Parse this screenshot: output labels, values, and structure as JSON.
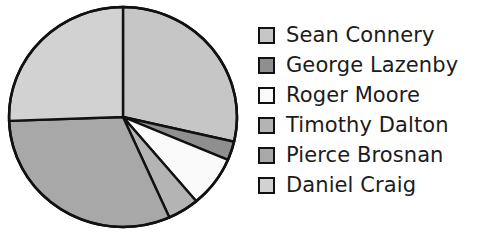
{
  "chart_data": {
    "type": "pie",
    "title": "",
    "subtitle": "",
    "xlabel": "",
    "ylabel": "",
    "grid": false,
    "legend_position": "right",
    "start_angle_deg": 0,
    "direction": "clockwise",
    "categories": [
      "Sean Connery",
      "George Lazenby",
      "Roger Moore",
      "Timothy Dalton",
      "Pierce Brosnan",
      "Daniel Craig"
    ],
    "values": [
      103,
      10,
      27,
      16,
      112,
      92
    ],
    "value_unit": "degrees",
    "percentages": [
      28.6,
      2.8,
      7.5,
      4.4,
      31.1,
      25.6
    ],
    "slices": [
      {
        "label": "Sean Connery",
        "angle_deg": 103,
        "percent": 28.6,
        "start_deg": 0,
        "end_deg": 103,
        "color": "#c6c6c6"
      },
      {
        "label": "George Lazenby",
        "angle_deg": 10,
        "percent": 2.8,
        "start_deg": 103,
        "end_deg": 113,
        "color": "#8f8f8f"
      },
      {
        "label": "Roger Moore",
        "angle_deg": 27,
        "percent": 7.5,
        "start_deg": 113,
        "end_deg": 140,
        "color": "#fafafa"
      },
      {
        "label": "Timothy Dalton",
        "angle_deg": 16,
        "percent": 4.4,
        "start_deg": 140,
        "end_deg": 156,
        "color": "#b4b4b4"
      },
      {
        "label": "Pierce Brosnan",
        "angle_deg": 112,
        "percent": 31.1,
        "start_deg": 156,
        "end_deg": 268,
        "color": "#a8a8a8"
      },
      {
        "label": "Daniel Craig",
        "angle_deg": 92,
        "percent": 25.6,
        "start_deg": 268,
        "end_deg": 360,
        "color": "#d2d2d2"
      }
    ],
    "outline_color": "#111111"
  },
  "legend": {
    "items": [
      {
        "label": "Sean Connery",
        "color": "#c6c6c6"
      },
      {
        "label": "George Lazenby",
        "color": "#8f8f8f"
      },
      {
        "label": "Roger Moore",
        "color": "#fafafa"
      },
      {
        "label": "Timothy Dalton",
        "color": "#b4b4b4"
      },
      {
        "label": "Pierce Brosnan",
        "color": "#a8a8a8"
      },
      {
        "label": "Daniel Craig",
        "color": "#d2d2d2"
      }
    ]
  }
}
